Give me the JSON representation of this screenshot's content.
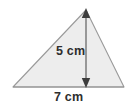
{
  "figure": {
    "type": "triangle-with-height",
    "title": "",
    "labels": {
      "height": "5 cm",
      "base": "7 cm"
    },
    "measurements": {
      "height_value": 5,
      "base_value": 7,
      "unit": "cm"
    },
    "colors": {
      "fill": "#ededed",
      "stroke": "#9a9a9a",
      "arrow": "#6b6b6b",
      "text": "#2e2e2e",
      "background": "#ffffff"
    },
    "geometry": {
      "apex": [
        86,
        10
      ],
      "bottom_left": [
        13,
        87
      ],
      "bottom_right": [
        124,
        87
      ],
      "height_line_x": 86,
      "height_line_top_y": 9,
      "height_line_bottom_y": 87
    }
  }
}
